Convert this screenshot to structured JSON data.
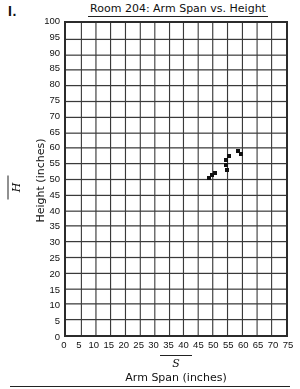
{
  "problem": {
    "number": "I."
  },
  "chart_data": {
    "type": "scatter",
    "title": "Room 204:  Arm Span vs. Height",
    "xlabel": "Arm Span (inches)",
    "ylabel": "Height (inches)",
    "x_variable": "S",
    "y_variable": "H",
    "xlim": [
      0,
      75
    ],
    "ylim": [
      0,
      100
    ],
    "xtick_step": 5,
    "ytick_step": 5,
    "grid": true,
    "legend": "none",
    "xticks": [
      0,
      5,
      10,
      15,
      20,
      25,
      30,
      35,
      40,
      45,
      50,
      55,
      60,
      65,
      70,
      75
    ],
    "yticks": [
      0,
      5,
      10,
      15,
      20,
      25,
      30,
      35,
      40,
      45,
      50,
      55,
      60,
      65,
      70,
      75,
      80,
      85,
      90,
      95,
      100
    ],
    "points": [
      {
        "x": 48.0,
        "y": 51.0
      },
      {
        "x": 49.0,
        "y": 52.0
      },
      {
        "x": 49.8,
        "y": 52.5
      },
      {
        "x": 53.5,
        "y": 55.0
      },
      {
        "x": 53.5,
        "y": 56.5
      },
      {
        "x": 53.8,
        "y": 53.5
      },
      {
        "x": 54.5,
        "y": 58.0
      },
      {
        "x": 57.5,
        "y": 59.5
      },
      {
        "x": 58.5,
        "y": 58.5
      }
    ],
    "colors": {
      "point": "#111111",
      "grid": "#3a3a3a",
      "border": "#2b2b2b",
      "background": "#ffffff"
    }
  }
}
